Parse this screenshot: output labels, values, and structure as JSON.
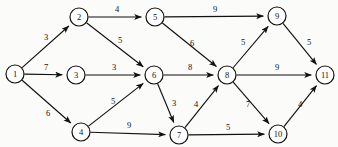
{
  "diagram": {
    "type": "directed-weighted-graph",
    "width": 338,
    "height": 147,
    "background_color": "#fbfbf9",
    "stroke_color": "#111111",
    "node_fill": "#ffffff",
    "node_radius": 9
  },
  "chart_data": {
    "type": "diagram",
    "title": "",
    "nodes": [
      {
        "id": "1",
        "label": "1",
        "x": 15,
        "y": 74
      },
      {
        "id": "2",
        "label": "2",
        "x": 79,
        "y": 17
      },
      {
        "id": "3",
        "label": "3",
        "x": 76,
        "y": 75
      },
      {
        "id": "4",
        "label": "4",
        "x": 81,
        "y": 132
      },
      {
        "id": "5",
        "label": "5",
        "x": 155,
        "y": 17
      },
      {
        "id": "6",
        "label": "6",
        "x": 154,
        "y": 75
      },
      {
        "id": "7",
        "label": "7",
        "x": 179,
        "y": 135
      },
      {
        "id": "8",
        "label": "8",
        "x": 227,
        "y": 75
      },
      {
        "id": "9",
        "label": "9",
        "x": 277,
        "y": 16
      },
      {
        "id": "10",
        "label": "10",
        "x": 278,
        "y": 134
      },
      {
        "id": "11",
        "label": "11",
        "x": 325,
        "y": 75
      }
    ],
    "edges": [
      {
        "from": "1",
        "to": "2",
        "weight": "3",
        "lx": 46,
        "ly": 37
      },
      {
        "from": "1",
        "to": "3",
        "weight": "7",
        "lx": 46,
        "ly": 67
      },
      {
        "from": "1",
        "to": "4",
        "weight": "6",
        "lx": 48,
        "ly": 113
      },
      {
        "from": "2",
        "to": "5",
        "weight": "4",
        "lx": 117,
        "ly": 9
      },
      {
        "from": "2",
        "to": "6",
        "weight": "5",
        "lx": 120,
        "ly": 40
      },
      {
        "from": "3",
        "to": "6",
        "weight": "3",
        "lx": 114,
        "ly": 67
      },
      {
        "from": "4",
        "to": "6",
        "weight": "5",
        "lx": 113,
        "ly": 101
      },
      {
        "from": "4",
        "to": "7",
        "weight": "9",
        "lx": 129,
        "ly": 125
      },
      {
        "from": "5",
        "to": "9",
        "weight": "9",
        "lx": 215,
        "ly": 9
      },
      {
        "from": "5",
        "to": "8",
        "weight": "6",
        "lx": 192,
        "ly": 43
      },
      {
        "from": "6",
        "to": "8",
        "weight": "8",
        "lx": 190,
        "ly": 67
      },
      {
        "from": "6",
        "to": "7",
        "weight": "3",
        "lx": 174,
        "ly": 103
      },
      {
        "from": "7",
        "to": "8",
        "weight": "4",
        "lx": 196,
        "ly": 104
      },
      {
        "from": "7",
        "to": "10",
        "weight": "5",
        "lx": 228,
        "ly": 127
      },
      {
        "from": "8",
        "to": "9",
        "weight": "5",
        "lx": 243,
        "ly": 42
      },
      {
        "from": "8",
        "to": "11",
        "weight": "9",
        "lx": 277,
        "ly": 67
      },
      {
        "from": "8",
        "to": "10",
        "weight": "7",
        "lx": 248,
        "ly": 104
      },
      {
        "from": "9",
        "to": "11",
        "weight": "5",
        "lx": 309,
        "ly": 42
      },
      {
        "from": "10",
        "to": "11",
        "weight": "4",
        "lx": 300,
        "ly": 104
      }
    ]
  }
}
